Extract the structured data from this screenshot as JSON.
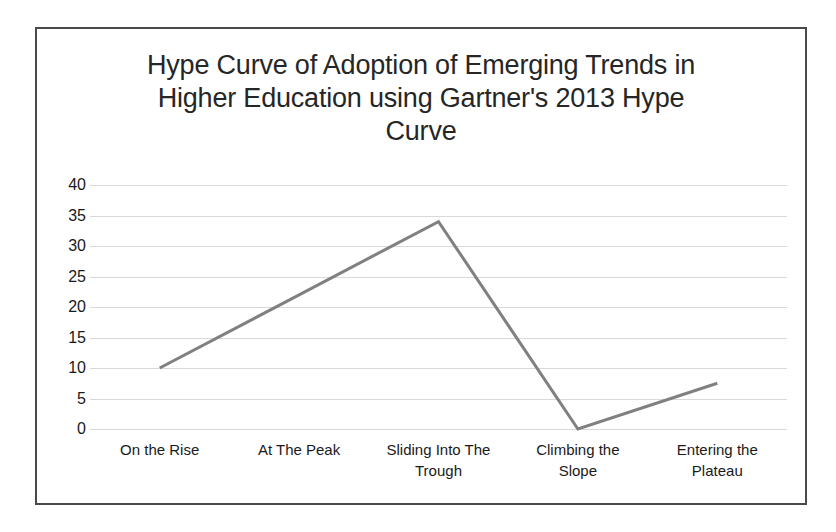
{
  "chart_data": {
    "type": "line",
    "title": "Hype Curve of Adoption of Emerging Trends in Higher Education using Gartner's 2013 Hype Curve",
    "title_lines": [
      "Hype Curve of Adoption of Emerging Trends in",
      "Higher Education using Gartner's 2013 Hype",
      "Curve"
    ],
    "categories": [
      "On the Rise",
      "At The Peak",
      "Sliding Into The Trough",
      "Climbing the Slope",
      "Entering the Plateau"
    ],
    "category_lines": [
      [
        "On the Rise"
      ],
      [
        "At The Peak"
      ],
      [
        "Sliding Into The",
        "Trough"
      ],
      [
        "Climbing the",
        "Slope"
      ],
      [
        "Entering the",
        "Plateau"
      ]
    ],
    "values": [
      10,
      22,
      34,
      0,
      7.5
    ],
    "series": [
      {
        "name": "Adoption",
        "values": [
          10,
          22,
          34,
          0,
          7.5
        ],
        "color": "#808080"
      }
    ],
    "xlabel": "",
    "ylabel": "",
    "ylim": [
      0,
      40
    ],
    "ytick_step": 5,
    "yticks": [
      40,
      35,
      30,
      25,
      20,
      15,
      10,
      5,
      0
    ],
    "ytick_labels": [
      "40",
      "35",
      "30",
      "25",
      "20",
      "15",
      "10",
      "5",
      "0"
    ],
    "grid": true,
    "grid_color": "#d9d9d9",
    "legend": false,
    "legend_position": "none",
    "line_color": "#808080",
    "line_width": 3,
    "markers": false,
    "border_color": "#4a4a4a",
    "background": "#ffffff"
  }
}
